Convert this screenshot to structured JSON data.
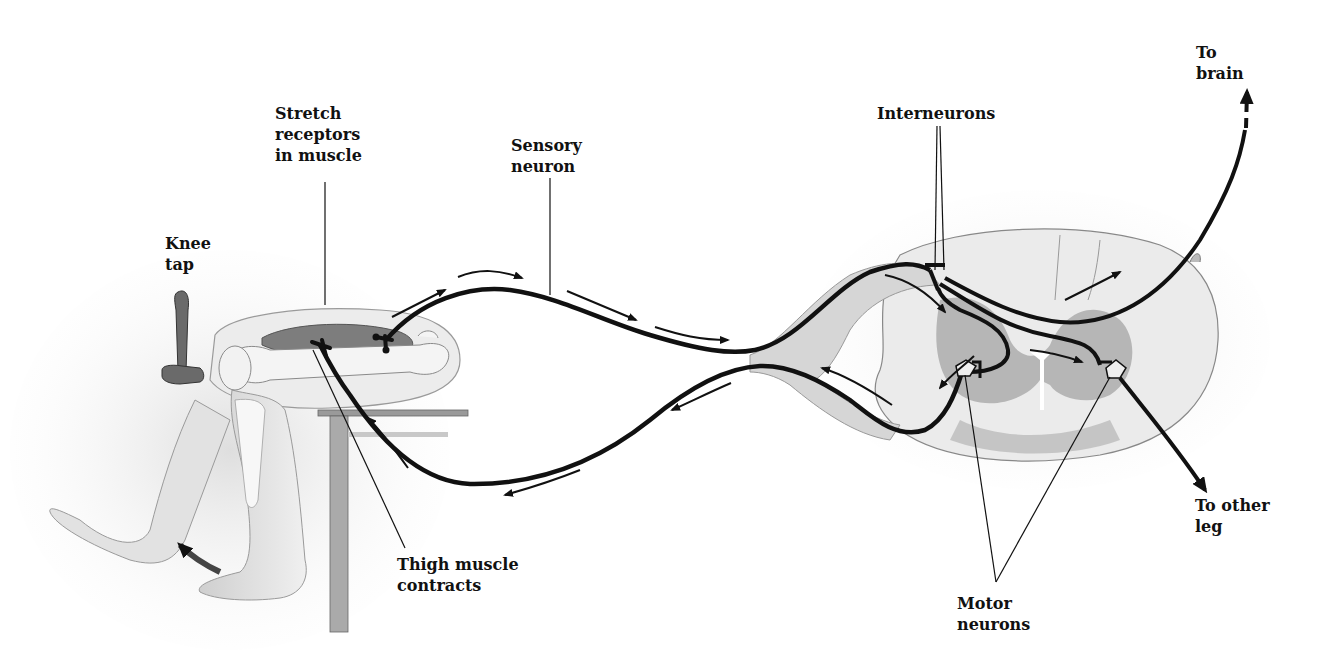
{
  "diagram": {
    "labels": {
      "stretch_receptors": "Stretch\nreceptors\nin muscle",
      "sensory_neuron": "Sensory\nneuron",
      "knee_tap": "Knee\ntap",
      "thigh_muscle": "Thigh muscle\ncontracts",
      "interneurons": "Interneurons",
      "to_brain": "To\nbrain",
      "to_other_leg": "To other\nleg",
      "motor_neurons": "Motor\nneurons"
    },
    "colors": {
      "ink": "#111111",
      "tissue_light": "#e6e6e6",
      "tissue_mid": "#c8c8c8",
      "tissue_dark": "#8c8c8c",
      "muscle": "#7a7a7a",
      "background": "#ffffff"
    },
    "components": [
      "leg-with-reflex-hammer",
      "thigh-muscle",
      "sensory-neuron-path",
      "motor-neuron-path",
      "spinal-cord-cross-section",
      "interneurons",
      "ascending-pathway-to-brain",
      "pathway-to-other-leg"
    ]
  }
}
